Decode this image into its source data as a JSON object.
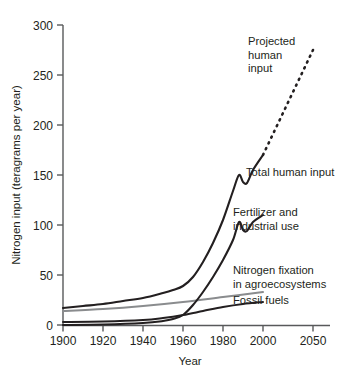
{
  "chart_data": {
    "type": "line",
    "title": "",
    "xlabel": "Year",
    "ylabel": "Nitrogen input (teragrams per year)",
    "xlim": [
      1900,
      2055
    ],
    "ylim": [
      0,
      300
    ],
    "xticks": [
      1900,
      1920,
      1940,
      1960,
      1980,
      2000,
      2050
    ],
    "xtick_labels": [
      "1900",
      "1920",
      "1940",
      "1960",
      "1980",
      "2000",
      "2050"
    ],
    "yticks": [
      0,
      50,
      100,
      150,
      200,
      250,
      300
    ],
    "ytick_labels": [
      "0",
      "50",
      "100",
      "150",
      "200",
      "250",
      "300"
    ],
    "grid": false,
    "legend_position": "inline-annotations",
    "series": [
      {
        "name": "Total human input",
        "color": "#231f20",
        "style": "solid",
        "x": [
          1900,
          1910,
          1920,
          1930,
          1940,
          1950,
          1955,
          1960,
          1965,
          1970,
          1975,
          1980,
          1985,
          1988,
          1990,
          1992,
          1995,
          2000
        ],
        "values": [
          17,
          19,
          21,
          24,
          27,
          32,
          35,
          39,
          48,
          63,
          82,
          105,
          134,
          150,
          143,
          142,
          155,
          170
        ]
      },
      {
        "name": "Fertilizer and industrial use",
        "color": "#231f20",
        "style": "solid",
        "x": [
          1900,
          1920,
          1940,
          1950,
          1955,
          1960,
          1965,
          1970,
          1975,
          1980,
          1985,
          1988,
          1990,
          1992,
          1995,
          2000
        ],
        "values": [
          0,
          0.5,
          2,
          4,
          6,
          10,
          20,
          33,
          48,
          65,
          85,
          103,
          95,
          94,
          103,
          110
        ]
      },
      {
        "name": "Nitrogen fixation in agroecosystems",
        "color": "#8a8c8e",
        "style": "solid",
        "x": [
          1900,
          1920,
          1940,
          1960,
          1980,
          2000
        ],
        "values": [
          14,
          16,
          19,
          23,
          28,
          33
        ]
      },
      {
        "name": "Fossil fuels",
        "color": "#231f20",
        "style": "solid",
        "x": [
          1900,
          1920,
          1940,
          1950,
          1960,
          1970,
          1980,
          1990,
          2000
        ],
        "values": [
          3,
          3.5,
          5,
          7,
          10,
          14,
          18,
          21,
          23
        ]
      },
      {
        "name": "Projected human input",
        "color": "#231f20",
        "style": "dashed",
        "x": [
          2000,
          2010,
          2020,
          2030,
          2040,
          2050
        ],
        "values": [
          170,
          191,
          212,
          233,
          254,
          275
        ]
      }
    ],
    "annotations": [
      {
        "label": "Projected\nhuman\ninput",
        "lines": [
          "Projected",
          "human",
          "input"
        ]
      },
      {
        "label": "Total human input",
        "lines": [
          "Total human input"
        ]
      },
      {
        "label": "Fertilizer and\nindustrial use",
        "lines": [
          "Fertilizer and",
          "industrial use"
        ]
      },
      {
        "label": "Nitrogen fixation\nin agroecosystems",
        "lines": [
          "Nitrogen fixation",
          "in agroecosystems"
        ]
      },
      {
        "label": "Fossil fuels",
        "lines": [
          "Fossil fuels"
        ]
      }
    ]
  },
  "labels": {
    "y_axis_title": "Nitrogen input (teragrams per year)",
    "x_axis_title": "Year",
    "ytick_0": "0",
    "ytick_50": "50",
    "ytick_100": "100",
    "ytick_150": "150",
    "ytick_200": "200",
    "ytick_250": "250",
    "ytick_300": "300",
    "xtick_1900": "1900",
    "xtick_1920": "1920",
    "xtick_1940": "1940",
    "xtick_1960": "1960",
    "xtick_1980": "1980",
    "xtick_2000": "2000",
    "xtick_2050": "2050",
    "ann_projected_1": "Projected",
    "ann_projected_2": "human",
    "ann_projected_3": "input",
    "ann_total": "Total human input",
    "ann_fert_1": "Fertilizer and",
    "ann_fert_2": "industrial use",
    "ann_fix_1": "Nitrogen fixation",
    "ann_fix_2": "in agroecosystems",
    "ann_fossil": "Fossil fuels"
  },
  "colors": {
    "line_black": "#231f20",
    "line_gray": "#8a8c8e",
    "axis": "#58595b",
    "background": "#ffffff"
  }
}
